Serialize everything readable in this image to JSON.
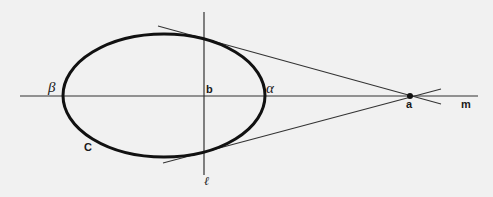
{
  "diagram": {
    "background": "#f1f1f1",
    "stroke_color": "#1a1a1a",
    "lines": {
      "m": {
        "x1": 20,
        "y1": 96,
        "x2": 478,
        "y2": 96
      },
      "l": {
        "x1": 204,
        "y1": 12,
        "x2": 204,
        "y2": 175
      },
      "tangent_upper": {
        "x1": 158,
        "y1": 26,
        "x2": 441,
        "y2": 104
      },
      "tangent_lower": {
        "x1": 163,
        "y1": 163,
        "x2": 441,
        "y2": 89
      }
    },
    "ellipse": {
      "cx": 164,
      "cy": 95.5,
      "rx": 101,
      "ry": 61.5
    },
    "point_a": {
      "cx": 410,
      "cy": 96,
      "r": 3
    },
    "labels": {
      "beta": "β",
      "b": "b",
      "alpha": "α",
      "a": "a",
      "m": "m",
      "C": "C",
      "ell": "ℓ"
    }
  }
}
